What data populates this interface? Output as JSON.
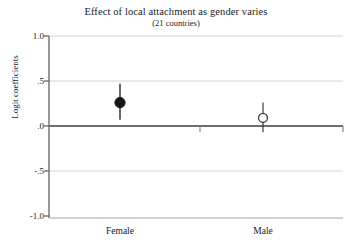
{
  "chart_data": {
    "type": "scatter",
    "title": "Effect of local attachment as gender varies",
    "subtitle": "(21 countries)",
    "xlabel": "",
    "ylabel": "Logit coefficients",
    "ylim": [
      -1.0,
      1.0
    ],
    "yticks": [
      1.0,
      0.5,
      0.0,
      -0.5,
      -1.0
    ],
    "ytick_labels": [
      "1.0",
      ".5",
      ".0",
      "-.5",
      "-1.0"
    ],
    "categories": [
      "Female",
      "Male"
    ],
    "grid": "horizontal-light",
    "zero_line": true,
    "legend": "none",
    "series": [
      {
        "name": "Local attachment effect",
        "points": [
          {
            "category": "Female",
            "value": 0.26,
            "ci_low": 0.07,
            "ci_high": 0.47,
            "marker": "filled-circle"
          },
          {
            "category": "Male",
            "value": 0.09,
            "ci_low": -0.07,
            "ci_high": 0.26,
            "marker": "open-circle"
          }
        ]
      }
    ]
  },
  "colors": {
    "axis": "#55585c",
    "zero_line": "#6b6e72",
    "grid": "#cfd2d6",
    "marker_fill": "#161616",
    "marker_stroke": "#161616",
    "text": "#1a1a1a"
  }
}
